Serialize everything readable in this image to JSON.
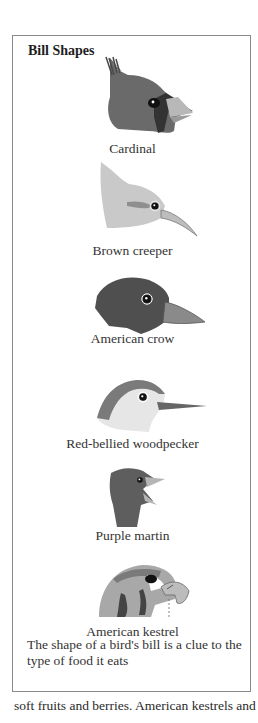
{
  "sidebar_box": {
    "title": "Bill Shapes",
    "birds": [
      {
        "name": "Cardinal",
        "icon": "cardinal-head-icon"
      },
      {
        "name": "Brown creeper",
        "icon": "brown-creeper-head-icon"
      },
      {
        "name": "American crow",
        "icon": "american-crow-head-icon"
      },
      {
        "name": "Red-bellied woodpecker",
        "icon": "woodpecker-head-icon"
      },
      {
        "name": "Purple martin",
        "icon": "purple-martin-head-icon"
      },
      {
        "name": "American kestrel",
        "icon": "american-kestrel-head-icon"
      }
    ],
    "caption": "The shape of a bird's bill is a clue to the type of food it eats"
  },
  "body": {
    "text": "soft fruits and berries. American kestrels and"
  }
}
